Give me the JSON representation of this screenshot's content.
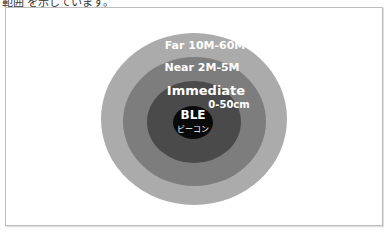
{
  "caption": "範囲 を示しています。",
  "diagram": {
    "zones": [
      {
        "name": "Far",
        "label": "Far 10M-60M",
        "color": "#ababab"
      },
      {
        "name": "Near",
        "label": "Near 2M-5M",
        "color": "#7d7d7d"
      },
      {
        "name": "Immediate",
        "label": "Immediate",
        "sublabel": "0-50cm",
        "color": "#4a4a4a"
      }
    ],
    "center": {
      "label": "BLE",
      "sublabel": "ビーコン",
      "color": "#0a0a0a"
    }
  }
}
